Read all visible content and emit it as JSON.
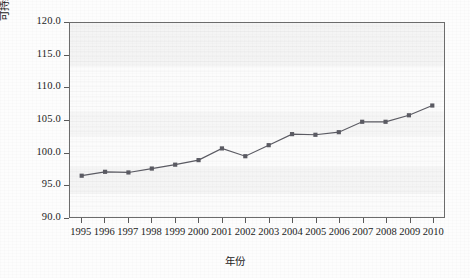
{
  "chart_data": {
    "type": "line",
    "title": "",
    "xlabel": "年份",
    "ylabel": "可持续发展能力(1995年全国为100)",
    "categories": [
      "1995",
      "1996",
      "1997",
      "1998",
      "1999",
      "2000",
      "2001",
      "2002",
      "2003",
      "2004",
      "2005",
      "2006",
      "2007",
      "2008",
      "2009",
      "2010"
    ],
    "values": [
      96.5,
      97.1,
      97.0,
      97.6,
      98.2,
      98.9,
      100.7,
      99.5,
      101.2,
      102.9,
      102.8,
      103.2,
      104.8,
      104.8,
      105.8,
      107.3
    ],
    "series": [
      {
        "name": "可持续发展能力",
        "values": [
          96.5,
          97.1,
          97.0,
          97.6,
          98.2,
          98.9,
          100.7,
          99.5,
          101.2,
          102.9,
          102.8,
          103.2,
          104.8,
          104.8,
          105.8,
          107.3
        ]
      }
    ],
    "ylim": [
      90.0,
      120.0
    ],
    "yticks": [
      "90.0",
      "95.0",
      "100.0",
      "105.0",
      "110.0",
      "115.0",
      "120.0"
    ],
    "ytick_values": [
      90.0,
      95.0,
      100.0,
      105.0,
      110.0,
      115.0,
      120.0
    ],
    "xticks": [
      "1995",
      "1996",
      "1997",
      "1998",
      "1999",
      "2000",
      "2001",
      "2002",
      "2003",
      "2004",
      "2005",
      "2006",
      "2007",
      "2008",
      "2009",
      "2010"
    ],
    "grid": false,
    "legend": "none",
    "marker": "square",
    "line_color": "#5b5b63",
    "marker_color": "#5b5b63",
    "frame_color": "#6d6d6d",
    "plot_background": "#fcfcfc"
  }
}
